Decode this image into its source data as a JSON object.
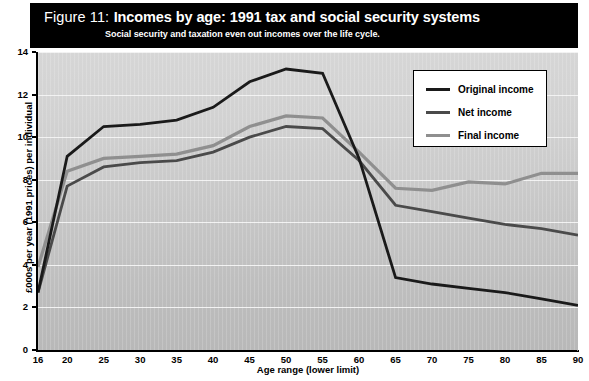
{
  "figure": {
    "number_label": "Figure 11:",
    "title": "Incomes by age: 1991 tax and social security systems",
    "subtitle": "Social  security and taxation even out incomes over the life cycle."
  },
  "colors": {
    "original_income": "#1a1a1a",
    "net_income": "#4a4a4a",
    "final_income": "#8f8f8f",
    "header_background": "#000000",
    "plot_background": "#c8c8c8",
    "gridline": "#f2f2f2"
  },
  "legend": {
    "position": "top-right",
    "items": [
      {
        "label": "Original income",
        "color": "#1a1a1a"
      },
      {
        "label": "Net income",
        "color": "#4a4a4a"
      },
      {
        "label": "Final income",
        "color": "#8f8f8f"
      }
    ]
  },
  "chart_data": {
    "type": "line",
    "title": "Incomes by age: 1991 tax and social security systems",
    "subtitle": "Social  security and taxation even out incomes over the life cycle.",
    "xlabel": "Age range (lower limit)",
    "ylabel": "£000s per year (1991 prices) per individual",
    "categories": [
      16,
      20,
      25,
      30,
      35,
      40,
      45,
      50,
      55,
      60,
      65,
      70,
      75,
      80,
      85,
      90
    ],
    "xticklabels": [
      "16",
      "20",
      "25",
      "30",
      "35",
      "40",
      "45",
      "50",
      "55",
      "60",
      "65",
      "70",
      "75",
      "80",
      "85",
      "90"
    ],
    "yticklabels": [
      "0",
      "2",
      "4",
      "6",
      "8",
      "10",
      "12",
      "14"
    ],
    "ytickvalues": [
      0,
      2,
      4,
      6,
      8,
      10,
      12,
      14
    ],
    "ylim": [
      0,
      14
    ],
    "grid": "horizontal",
    "legend_position": "upper right",
    "series": [
      {
        "name": "Original income",
        "color": "#1a1a1a",
        "values": [
          2.7,
          9.1,
          10.5,
          10.6,
          10.8,
          11.4,
          12.6,
          13.2,
          13.0,
          9.0,
          3.4,
          3.1,
          2.9,
          2.7,
          2.4,
          2.1
        ]
      },
      {
        "name": "Net income",
        "color": "#4a4a4a",
        "values": [
          2.7,
          7.7,
          8.6,
          8.8,
          8.9,
          9.3,
          10.0,
          10.5,
          10.4,
          8.9,
          6.8,
          6.5,
          6.2,
          5.9,
          5.7,
          5.4
        ]
      },
      {
        "name": "Final income",
        "color": "#8f8f8f",
        "values": [
          3.9,
          8.4,
          9.0,
          9.1,
          9.2,
          9.6,
          10.5,
          11.0,
          10.9,
          9.3,
          7.6,
          7.5,
          7.9,
          7.8,
          8.3,
          8.3
        ]
      }
    ]
  }
}
